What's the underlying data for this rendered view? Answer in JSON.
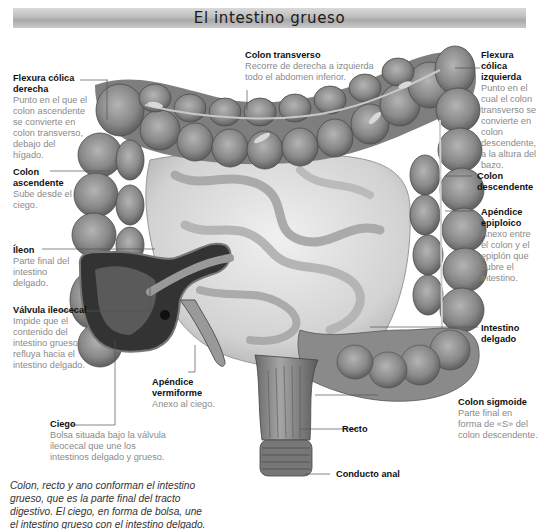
{
  "title": "El intestino grueso",
  "labels": {
    "flexura_derecha": {
      "name": "Flexura cólica derecha",
      "desc": "Punto en el que el colon ascendente se convierte en colon transverso, debajo del hígado."
    },
    "colon_transverso": {
      "name": "Colon transverso",
      "desc": "Recorre de derecha a izquierda todo el abdomen inferior."
    },
    "flexura_izquierda": {
      "name": "Flexura cólica izquierda",
      "desc": "Punto en el cual el colon transverso se convierte en colon descendente, a la altura del bazo."
    },
    "colon_ascendente": {
      "name": "Colon ascendente",
      "desc": "Sube desde el ciego."
    },
    "colon_descendente": {
      "name": "Colon descendente",
      "desc": ""
    },
    "apendice_epiploico": {
      "name": "Apéndice epiploico",
      "desc": "Anexo entre el colon y el epiplón que cubre el intestino."
    },
    "ileon": {
      "name": "Íleon",
      "desc": "Parte final del intestino delgado."
    },
    "valvula_ileocecal": {
      "name": "Válvula ileocecal",
      "desc": "Impide que el contenido del intestino grueso refluya hacia el intestino delgado."
    },
    "intestino_delgado": {
      "name": "Intestino delgado",
      "desc": ""
    },
    "apendice_vermiforme": {
      "name": "Apéndice vermiforme",
      "desc": "Anexo al ciego."
    },
    "ciego": {
      "name": "Ciego",
      "desc": "Bolsa situada bajo la válvula ileocecal que une los intestinos delgado y grueso."
    },
    "colon_sigmoide": {
      "name": "Colon sigmoide",
      "desc": "Parte final en forma de «S» del colon descendente."
    },
    "recto": {
      "name": "Recto",
      "desc": ""
    },
    "conducto_anal": {
      "name": "Conducto anal",
      "desc": ""
    }
  },
  "caption": "Colon, recto y ano conforman el intestino grueso, que es la parte final del tracto digestivo. El ciego, en forma de bolsa, une el intestino grueso con el intestino delgado.",
  "colors": {
    "colon": "#8e8e8e",
    "colon_dark": "#5e5e5e",
    "small_intestine": "#d8d8d8",
    "leader_line": "#555555",
    "desc_text": "#8a8a8a"
  }
}
